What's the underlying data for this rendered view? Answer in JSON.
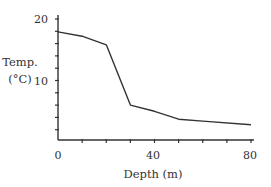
{
  "chart_data": {
    "type": "line",
    "title": "",
    "xlabel": "Depth (m)",
    "ylabel_lines": [
      "Temp.",
      "(°C)"
    ],
    "ylabel": "Temp. (°C)",
    "x": [
      0,
      10,
      20,
      30,
      40,
      50,
      60,
      80
    ],
    "series": [
      {
        "name": "Temperature",
        "values": [
          17.9,
          17.2,
          15.8,
          6.0,
          5.0,
          3.7,
          3.4,
          2.8
        ],
        "color": "#333333"
      }
    ],
    "xlim": [
      0,
      80
    ],
    "ylim": [
      0,
      20
    ],
    "xticks_major": [
      0,
      40,
      80
    ],
    "xticks_minor_step": 10,
    "yticks_major": [
      10,
      20
    ],
    "yticks_minor_step": 2,
    "xtick_labels": [
      "0",
      "40",
      "80"
    ],
    "ytick_labels": [
      "10",
      "20"
    ],
    "grid": false,
    "legend": null
  },
  "labels": {
    "y_line1": "Temp.",
    "y_line2": "(°C)",
    "x_axis": "Depth (m)",
    "xtick_0": "0",
    "xtick_40": "40",
    "xtick_80": "80",
    "ytick_10": "10",
    "ytick_20": "20"
  },
  "colors": {
    "line": "#333333",
    "axis": "#333333",
    "text": "#333333"
  }
}
